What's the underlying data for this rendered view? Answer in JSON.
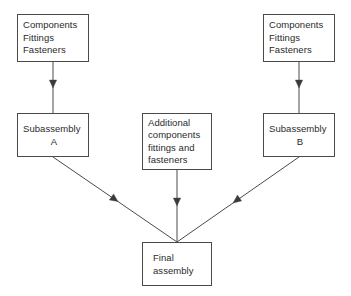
{
  "diagram": {
    "background_color": "#ffffff",
    "line_color": "#4a4a4a",
    "text_color": "#2b2b2b",
    "nodes": [
      {
        "id": "components-left",
        "lines": [
          "Components",
          "Fittings",
          "Fasteners"
        ]
      },
      {
        "id": "components-right",
        "lines": [
          "Components",
          "Fittings",
          "Fasteners"
        ]
      },
      {
        "id": "subassembly-a",
        "lines": [
          "Subassembly",
          "A"
        ]
      },
      {
        "id": "subassembly-b",
        "lines": [
          "Subassembly",
          "B"
        ]
      },
      {
        "id": "additional",
        "lines": [
          "Additional",
          "components",
          "fittings and",
          "fasteners"
        ]
      },
      {
        "id": "final-assembly",
        "lines": [
          "Final",
          "assembly"
        ]
      }
    ],
    "edges": [
      {
        "id": "edge-left-down",
        "from": "components-left",
        "to": "subassembly-a"
      },
      {
        "id": "edge-right-down",
        "from": "components-right",
        "to": "subassembly-b"
      },
      {
        "id": "edge-a-to-final",
        "from": "subassembly-a",
        "to": "final-assembly"
      },
      {
        "id": "edge-b-to-final",
        "from": "subassembly-b",
        "to": "final-assembly"
      },
      {
        "id": "edge-extra-to-final",
        "from": "additional",
        "to": "final-assembly"
      }
    ]
  }
}
